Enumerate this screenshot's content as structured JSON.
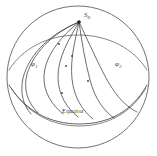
{
  "figure": {
    "kind": "sphere-ray-path-diagram",
    "background_color": "#ffffff",
    "line_color": "#4a4a4a",
    "width": 157,
    "height": 156
  },
  "sphere": {
    "center_x": 78,
    "center_y": 77,
    "radius": 71,
    "outline_label": "sphere-outline"
  },
  "labels": {
    "apex": "S",
    "apex_sub": "0",
    "left_curve": "φ",
    "left_curve_sub": "1",
    "right_curve": "φ",
    "right_curve_sub": "2",
    "equator": "Equator"
  },
  "apex_point": {
    "x": 79,
    "y": 22,
    "name": "source-point"
  },
  "curves": {
    "count": 6,
    "description": "fan of great-circle ray paths from source point",
    "paths": [
      "M79,22 C58,30 36,47 28,73 C24,88 28,100 37,110",
      "M79,22 C64,34 47,52 45,74 C44,90 52,103 63,112",
      "M79,22 C70,38 59,56 59,76 C59,94 68,107 78,116",
      "M79,22 C76,40 71,58 73,78 C75,97 83,110 93,118",
      "M79,22 C82,42 84,60 89,79 C94,98 103,110 113,117",
      "M79,22 C88,42 96,60 105,77 C116,97 126,106 136,111"
    ]
  },
  "markers": [
    {
      "x": 59,
      "y": 44,
      "name": "curve-marker"
    },
    {
      "x": 72,
      "y": 55,
      "name": "curve-marker"
    },
    {
      "x": 66,
      "y": 65,
      "name": "curve-marker"
    },
    {
      "x": 88,
      "y": 81,
      "name": "curve-marker"
    },
    {
      "x": 62,
      "y": 92,
      "name": "curve-marker"
    }
  ],
  "equator_arc": {
    "path": "M13,93 C36,118 60,124 82,123 C108,122 130,112 145,93",
    "name": "equator-arc"
  },
  "horizon_arc": {
    "path": "M12,68 C28,49 52,38 79,38 C106,38 130,49 146,68",
    "name": "upper-latitude-arc"
  }
}
